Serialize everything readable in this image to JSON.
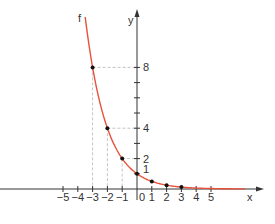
{
  "chart_data": {
    "type": "line",
    "title": "",
    "function_label": "f",
    "function": "f(x) = (1/2)^x",
    "xlabel": "x",
    "ylabel": "y",
    "x_ticks": [
      -5,
      -4,
      -3,
      -2,
      -1,
      0,
      1,
      2,
      3,
      4,
      5
    ],
    "x_tick_labels": [
      "−5",
      "−4",
      "−3",
      "−2",
      "−1",
      "0",
      "1",
      "2",
      "3",
      "4",
      "5"
    ],
    "y_ticks": [
      1,
      2,
      3,
      4,
      5,
      6,
      7,
      8
    ],
    "y_tick_labels": [
      {
        "value": 1,
        "label": "1"
      },
      {
        "value": 2,
        "label": "2"
      },
      {
        "value": 4,
        "label": "4"
      },
      {
        "value": 8,
        "label": "8"
      }
    ],
    "xlim": [
      -9.2,
      8.6
    ],
    "ylim": [
      -2.3,
      11.8
    ],
    "curve_domain": [
      -3.5,
      7.3
    ],
    "series": [
      {
        "name": "f",
        "color": "#e8513a",
        "points": [
          {
            "x": -3,
            "y": 8
          },
          {
            "x": -2,
            "y": 4
          },
          {
            "x": -1,
            "y": 2
          },
          {
            "x": 0,
            "y": 1
          },
          {
            "x": 1,
            "y": 0.5
          },
          {
            "x": 2,
            "y": 0.25
          },
          {
            "x": 3,
            "y": 0.125
          }
        ]
      }
    ],
    "guide_lines": [
      {
        "x": -3,
        "y": 8
      },
      {
        "x": -2,
        "y": 4
      },
      {
        "x": -1,
        "y": 2
      }
    ],
    "grid": false,
    "legend": "none"
  }
}
